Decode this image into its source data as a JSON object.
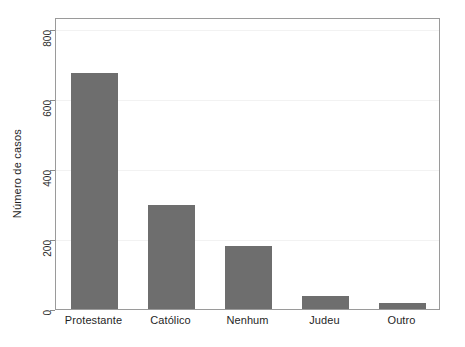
{
  "chart_data": {
    "type": "bar",
    "title": "",
    "subtitle": "",
    "xlabel": "",
    "ylabel": "Número de casos",
    "categories": [
      "Protestante",
      "Católico",
      "Nenhum",
      "Judeu",
      "Outro"
    ],
    "values": [
      674,
      297,
      181,
      37,
      17
    ],
    "ylim": [
      0,
      840
    ],
    "yticks": [
      0,
      200,
      400,
      600,
      800
    ],
    "ytick_labels": [
      "0",
      "200",
      "400",
      "600",
      "800"
    ],
    "grid": true,
    "grid_axis": "y",
    "legend": null,
    "legend_position": "none",
    "bar_color": "#6e6e6e",
    "grid_color": "#f2f2f2",
    "frame_color": "#9a9a9a",
    "background_color": "#ffffff",
    "annotations": []
  },
  "axis": {
    "y_title": "Número de casos",
    "y_tick_0": "0",
    "y_tick_1": "200",
    "y_tick_2": "400",
    "y_tick_3": "600",
    "y_tick_4": "800"
  },
  "labels": {
    "cat_0": "Protestante",
    "cat_1": "Católico",
    "cat_2": "Nenhum",
    "cat_3": "Judeu",
    "cat_4": "Outro"
  }
}
